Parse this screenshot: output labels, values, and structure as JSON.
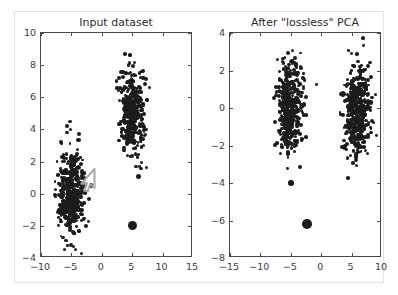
{
  "figure": {
    "background": "#ffffff",
    "frame_color": "#e3e3e3",
    "axis_color": "#4a4a4a",
    "marker_color": "#1c1c1c",
    "cursor_color": "#a8a8a8"
  },
  "panels": [
    {
      "id": "input-dataset",
      "title": "Input dataset",
      "xticklabels": [
        "-10",
        "-5",
        "0",
        "5",
        "10",
        "15"
      ],
      "yticklabels": [
        "-4",
        "-2",
        "0",
        "2",
        "4",
        "6",
        "8",
        "10"
      ]
    },
    {
      "id": "after-lossless-pca",
      "title": "After \"lossless\" PCA",
      "xticklabels": [
        "-15",
        "-10",
        "-5",
        "0",
        "5",
        "10"
      ],
      "yticklabels": [
        "-8",
        "-6",
        "-4",
        "-2",
        "0",
        "2",
        "4"
      ]
    }
  ],
  "chart_data": [
    {
      "type": "scatter",
      "title": "Input dataset",
      "xlabel": "",
      "ylabel": "",
      "xlim": [
        -10,
        15
      ],
      "ylim": [
        -4,
        10
      ],
      "xticks": [
        -10,
        -5,
        0,
        5,
        10,
        15
      ],
      "yticks": [
        -4,
        -2,
        0,
        2,
        4,
        6,
        8,
        10
      ],
      "grid": false,
      "legend": "none",
      "marker_color": "#1c1c1c",
      "series": [
        {
          "name": "cluster-lower-left",
          "center": [
            -5.0,
            0.0
          ],
          "spread": [
            1.1,
            1.35
          ],
          "n": 430,
          "marker_size": 3.2
        },
        {
          "name": "cluster-upper-right",
          "center": [
            5.0,
            5.0
          ],
          "spread": [
            1.0,
            1.25
          ],
          "n": 400,
          "marker_size": 3.2
        }
      ],
      "outliers": [
        {
          "x": 6.0,
          "y": 1.05,
          "marker_size": 2.6
        },
        {
          "x": 5.0,
          "y": -2.0,
          "marker_size": 4.6
        }
      ],
      "annotations": [
        {
          "type": "mouse-cursor",
          "x": -1.4,
          "y": 1.45
        }
      ]
    },
    {
      "type": "scatter",
      "title": "After \"lossless\" PCA",
      "xlabel": "",
      "ylabel": "",
      "xlim": [
        -15,
        10
      ],
      "ylim": [
        -8,
        4
      ],
      "xticks": [
        -15,
        -10,
        -5,
        0,
        5,
        10
      ],
      "yticks": [
        -8,
        -6,
        -4,
        -2,
        0,
        2,
        4
      ],
      "grid": false,
      "legend": "none",
      "marker_color": "#1c1c1c",
      "series": [
        {
          "name": "cluster-left",
          "center": [
            -5.2,
            -0.05
          ],
          "spread": [
            1.05,
            1.2
          ],
          "n": 430,
          "marker_size": 3.2
        },
        {
          "name": "cluster-right",
          "center": [
            6.0,
            -0.15
          ],
          "spread": [
            1.1,
            1.2
          ],
          "n": 430,
          "marker_size": 3.2
        }
      ],
      "outliers": [
        {
          "x": -5.0,
          "y": -4.0,
          "marker_size": 2.8
        },
        {
          "x": -2.3,
          "y": -6.2,
          "marker_size": 4.8
        }
      ],
      "annotations": []
    }
  ]
}
